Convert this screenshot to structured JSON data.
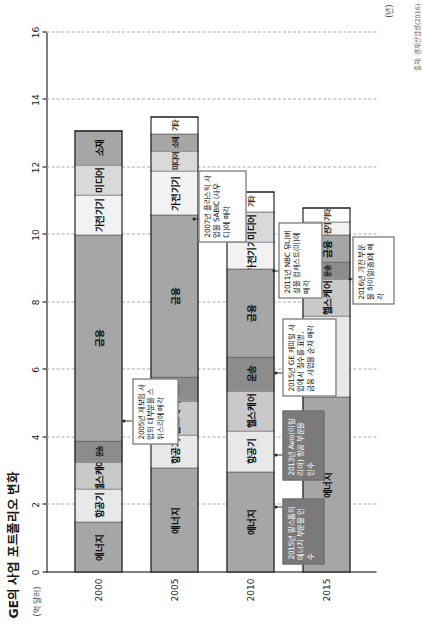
{
  "title": "GE의 사업 포트폴리오 변화",
  "axis": {
    "value_unit": "(억 달러)",
    "category_unit": "(년)",
    "value_ticks": [
      "0",
      "2",
      "4",
      "6",
      "8",
      "10",
      "12",
      "14",
      "16"
    ],
    "value_min": 0,
    "value_max": 16,
    "category_ticks": [
      "2000",
      "2005",
      "2010",
      "2015"
    ]
  },
  "source": "출처: 경제산업성(2016)",
  "legend_colors": {
    "energy": "#a6a6a6",
    "aircraft": "#e8e8e8",
    "healthcare": "#c9c9c9",
    "transport": "#8c8c8c",
    "finance": "#a6a6a6",
    "appliance": "#f2f2f2",
    "media": "#d9d9d9",
    "material": "#a6a6a6",
    "other": "#ffffff",
    "callout_fill": "#7a7a7a"
  },
  "chart_data": {
    "type": "bar",
    "orientation": "horizontal-stacked",
    "title": "GE의 사업 포트폴리오 변화",
    "xlabel": "(억 달러)",
    "ylabel": "(년)",
    "xlim": [
      0,
      16
    ],
    "grid": true,
    "legend_position": "none-inline-labels",
    "categories": [
      "2000",
      "2005",
      "2010",
      "2015"
    ],
    "series": [
      {
        "name": "에너지",
        "key": "energy",
        "color": "#a6a6a6",
        "values": [
          1.5,
          3.1,
          3.0,
          5.2
        ]
      },
      {
        "name": "항공기",
        "key": "aircraft",
        "color": "#e8e8e8",
        "values": [
          1.0,
          1.0,
          1.2,
          2.4
        ]
      },
      {
        "name": "헬스케어",
        "key": "healthcare",
        "color": "#c9c9c9",
        "values": [
          0.8,
          1.0,
          1.2,
          1.1
        ]
      },
      {
        "name": "운송",
        "key": "transport",
        "color": "#8c8c8c",
        "values": [
          0.6,
          0.7,
          1.0,
          0.5
        ]
      },
      {
        "name": "금융",
        "key": "finance",
        "color": "#a6a6a6",
        "values": [
          6.1,
          4.8,
          2.6,
          0.8
        ]
      },
      {
        "name": "가전기기",
        "key": "appliance",
        "color": "#f2f2f2",
        "values": [
          1.2,
          1.3,
          0.8,
          0.4
        ]
      },
      {
        "name": "미디어",
        "key": "media",
        "color": "#d9d9d9",
        "values": [
          0.9,
          0.6,
          0.9,
          0.0
        ]
      },
      {
        "name": "소재",
        "key": "material",
        "color": "#a6a6a6",
        "values": [
          1.0,
          0.5,
          0.0,
          0.0
        ]
      },
      {
        "name": "기타",
        "key": "other",
        "color": "#ffffff",
        "values": [
          0.0,
          0.5,
          0.6,
          0.4
        ]
      }
    ],
    "totals": [
      13.1,
      13.5,
      11.3,
      10.8
    ]
  },
  "annotations": [
    {
      "id": "a2005-insurance",
      "text": "2005년 재보험 사업의 대부분을 스위스리에 매각",
      "style": "outline",
      "target_year": "2000"
    },
    {
      "id": "a2007-sabic",
      "text": "2007년 플라스틱 사업을 SABIC (사우디)에 매각",
      "style": "outline",
      "target_year": "2005"
    },
    {
      "id": "a2015-alstom",
      "text": "2015년 알스톰의 에너지 부문을 인수",
      "style": "filled",
      "target_year": "2010"
    },
    {
      "id": "a2013-avio",
      "text": "2013년 Avio(이탈리아) 항공 부문을 인수",
      "style": "filled",
      "target_year": "2010"
    },
    {
      "id": "a2015-gecapital",
      "text": "2015년 GE 캐피털 사업에서 철수를 표명, 금융 사업을 순차 매각",
      "style": "outline",
      "target_year": "2010"
    },
    {
      "id": "a2011-nbc",
      "text": "2011년 NBC 유니버설을 컴캐스트(미)에 매각",
      "style": "outline",
      "target_year": "2010"
    },
    {
      "id": "a2016-haier",
      "text": "2016년 가전 부문을 하이얼(중)에 매각",
      "style": "outline",
      "target_year": "2015"
    }
  ]
}
